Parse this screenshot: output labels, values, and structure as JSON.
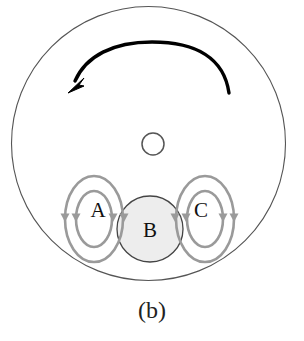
{
  "figure": {
    "caption": "(b)",
    "domain_circle": {
      "name": "outer-boundary-circle",
      "cx": 148.5,
      "cy": 143.5,
      "r": 137,
      "stroke": "#555555",
      "stroke_width": 1.1,
      "fill": "none"
    },
    "rotation_arrow": {
      "name": "rotation-arrow",
      "direction": "counterclockwise",
      "stroke": "#000000",
      "stroke_width": 3.2,
      "arrowhead": "left-down"
    },
    "center_circle": {
      "name": "center-small-circle",
      "cx": 153,
      "cy": 144,
      "r": 11,
      "stroke": "#555555",
      "stroke_width": 1.4,
      "fill": "none"
    },
    "region_b": {
      "label": "B",
      "cx": 150,
      "cy": 229,
      "r": 33,
      "fill": "#ededed",
      "stroke": "#444444",
      "stroke_width": 1.3,
      "label_x": 150,
      "label_y": 232
    },
    "vortices": [
      {
        "label": "A",
        "cx": 94,
        "cy": 219,
        "label_x": 98,
        "label_y": 212,
        "rings": [
          {
            "rx": 29,
            "ry": 43
          },
          {
            "rx": 18,
            "ry": 28
          }
        ]
      },
      {
        "label": "C",
        "cx": 205,
        "cy": 219,
        "label_x": 201,
        "label_y": 212,
        "rings": [
          {
            "rx": 29,
            "ry": 43
          },
          {
            "rx": 18,
            "ry": 28
          }
        ]
      }
    ],
    "vortex_style": {
      "stroke": "#9a9a9a",
      "stroke_width": 2.6,
      "fill": "none",
      "arrow_fill": "#9a9a9a"
    }
  }
}
